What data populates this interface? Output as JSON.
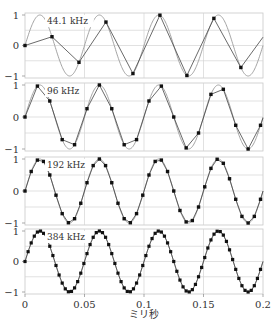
{
  "chart_data": {
    "type": "line",
    "title": "",
    "xlabel": "ミリ秒",
    "ylabel": "",
    "xlim": [
      0,
      0.2
    ],
    "ylim": [
      -1,
      1
    ],
    "x_ticks": [
      "0",
      "0.05",
      "0.1",
      "0.15",
      "0.2"
    ],
    "x_tick_values": [
      0,
      0.05,
      0.1,
      0.15,
      0.2
    ],
    "y_ticks": [
      "1",
      "0",
      "-1"
    ],
    "y_tick_values": [
      1,
      0,
      -1
    ],
    "grid": true,
    "signal": {
      "name": "20 kHz sine",
      "frequency_khz": 20,
      "amplitude": 1
    },
    "panels": [
      {
        "label": "44.1 kHz",
        "sample_rate_khz": 44.1
      },
      {
        "label": "96 kHz",
        "sample_rate_khz": 96
      },
      {
        "label": "192 kHz",
        "sample_rate_khz": 192
      },
      {
        "label": "384 kHz",
        "sample_rate_khz": 384
      }
    ]
  },
  "colors": {
    "signal": "#9a9a9a",
    "samples": "#111111",
    "sample_line": "#444444",
    "grid": "#d4d4d4",
    "frame": "#c8c8c8"
  }
}
